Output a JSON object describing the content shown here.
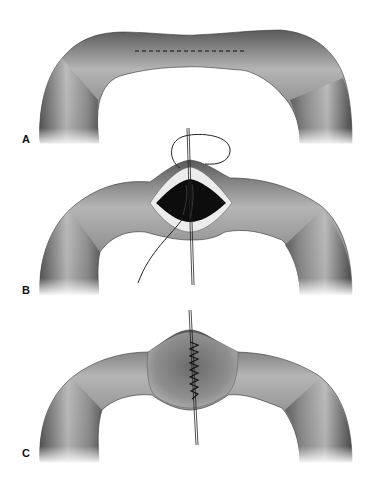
{
  "figure": {
    "panels": [
      {
        "label": "A",
        "description": "intestinal loop with longitudinal incision line (dashed)"
      },
      {
        "label": "B",
        "description": "incision opened with traction sutures and suture thread"
      },
      {
        "label": "C",
        "description": "transverse closure with running suture"
      }
    ]
  },
  "colors": {
    "bowel_mid": "#8a8a8a",
    "bowel_dark": "#3a3a3a",
    "bowel_light": "#cfcfcf",
    "lumen": "#0d0d0d",
    "mucosa_rim": "#e8e8e8",
    "suture": "#222222"
  }
}
